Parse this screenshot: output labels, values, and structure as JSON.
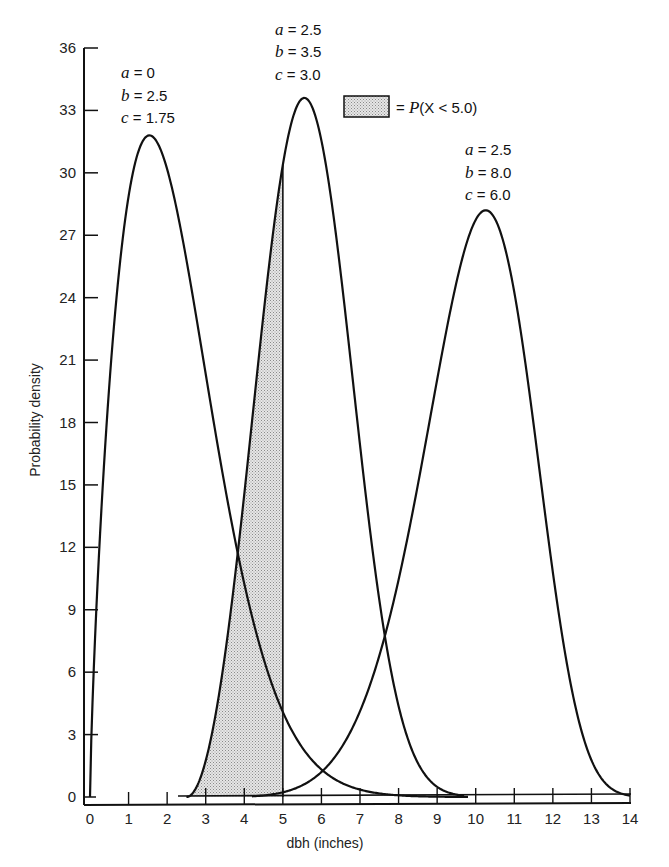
{
  "chart_data": {
    "type": "line",
    "title": "",
    "xlabel": "dbh (inches)",
    "ylabel": "Probability density",
    "xlim": [
      0,
      14
    ],
    "ylim": [
      0,
      36
    ],
    "x_ticks": [
      0,
      1,
      2,
      3,
      4,
      5,
      6,
      7,
      8,
      9,
      10,
      11,
      12,
      13,
      14
    ],
    "y_ticks": [
      0,
      3,
      6,
      9,
      12,
      15,
      18,
      21,
      24,
      27,
      30,
      33,
      36
    ],
    "grid": false,
    "legend": {
      "position": "top-center",
      "entries": [
        {
          "swatch": "stippled-gray",
          "label": "= P(X < 5.0)",
          "prefix": "= ",
          "var": "P",
          "rest": "(X < 5.0)"
        }
      ]
    },
    "series": [
      {
        "name": "a = 0, b = 2.5, c = 1.75",
        "params": {
          "a": "0",
          "b": "2.5",
          "c": "1.75"
        },
        "distribution": "weibull",
        "peak": {
          "x": 1.45,
          "y": 31.8
        },
        "x": [
          0,
          0.25,
          0.5,
          1.0,
          1.45,
          2.0,
          3.0,
          3.9,
          5.0,
          6.0,
          7.0,
          8.0,
          9.0
        ],
        "values": [
          0,
          13.0,
          19.5,
          28.3,
          31.8,
          29.5,
          19.0,
          11.8,
          4.3,
          1.4,
          0.4,
          0.1,
          0
        ]
      },
      {
        "name": "a = 2.5, b = 3.5, c = 3.0",
        "params": {
          "a": "2.5",
          "b": "3.5",
          "c": "3.0"
        },
        "distribution": "weibull",
        "peak": {
          "x": 5.4,
          "y": 33.6
        },
        "x": [
          2.5,
          3.0,
          3.5,
          3.9,
          4.5,
          5.0,
          5.4,
          6.0,
          7.0,
          7.7,
          8.5,
          9.5
        ],
        "values": [
          0,
          2.0,
          6.5,
          11.8,
          22.5,
          29.9,
          33.6,
          31.0,
          17.5,
          8.2,
          2.0,
          0
        ]
      },
      {
        "name": "a = 2.5, b = 8.0, c = 6.0",
        "params": {
          "a": "2.5",
          "b": "8.0",
          "c": "6.0"
        },
        "distribution": "weibull",
        "peak": {
          "x": 10.2,
          "y": 28.2
        },
        "x": [
          4.0,
          5.0,
          6.0,
          7.0,
          7.7,
          8.5,
          9.5,
          10.2,
          11.0,
          12.0,
          13.0,
          14.0
        ],
        "values": [
          0,
          0.6,
          2.0,
          5.2,
          8.2,
          14.5,
          24.5,
          28.2,
          26.0,
          15.0,
          4.0,
          0.3
        ]
      }
    ],
    "annotations": [
      {
        "text": "shaded area under a=2.5,b=3.5,c=3.0 curve from x=2.5 to x=5.0",
        "meaning": "P(X < 5.0)"
      },
      {
        "text": "vertical line at x = 5.0"
      }
    ]
  },
  "labels": {
    "xlabel": "dbh (inches)",
    "ylabel": "Probability density",
    "x_ticks": [
      "0",
      "1",
      "2",
      "3",
      "4",
      "5",
      "6",
      "7",
      "8",
      "9",
      "10",
      "11",
      "12",
      "13",
      "14"
    ],
    "y_ticks": [
      "0",
      "3",
      "6",
      "9",
      "12",
      "15",
      "18",
      "21",
      "24",
      "27",
      "30",
      "33",
      "36"
    ],
    "legend_eq": "= ",
    "legend_P": "P",
    "legend_rest": "(X < 5.0)",
    "curve1": {
      "a": " = 0",
      "b": " = 2.5",
      "c": " = 1.75"
    },
    "curve2": {
      "a": " = 2.5",
      "b": " = 3.5",
      "c": " = 3.0"
    },
    "curve3": {
      "a": " = 2.5",
      "b": " = 8.0",
      "c": " = 6.0"
    }
  }
}
